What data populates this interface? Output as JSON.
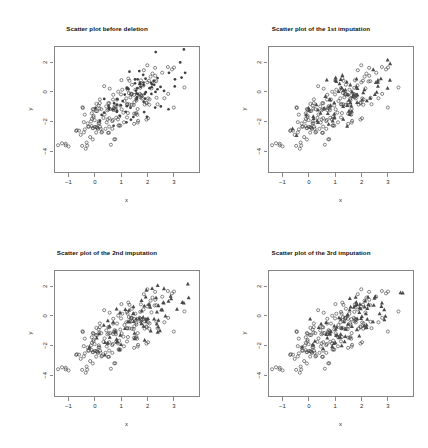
{
  "figure": {
    "width": 428,
    "height": 448,
    "background": "#ffffff",
    "layout": "2x2 grid of scatter plots",
    "marker_color": "#3f3f3f",
    "axis_color": "#555555"
  },
  "panels": [
    {
      "id": "before-deletion",
      "title": "Scatter plot before deletion",
      "xlabel": "x",
      "ylabel": "y"
    },
    {
      "id": "imputation-1",
      "title": "Scatter plot of the 1st imputation",
      "xlabel": "x",
      "ylabel": "y"
    },
    {
      "id": "imputation-2",
      "title": "Scatter plot of the 2nd imputation",
      "xlabel": "x",
      "ylabel": "y"
    },
    {
      "id": "imputation-3",
      "title": "Scatter plot of the 3rd imputation",
      "xlabel": "x",
      "ylabel": "y"
    }
  ],
  "chart_data": [
    {
      "type": "scatter",
      "panel": "before-deletion",
      "title": "Scatter plot before deletion",
      "xlabel": "x",
      "ylabel": "y",
      "xticks": [
        -1,
        0,
        1,
        2,
        3
      ],
      "yticks": [
        2,
        0,
        -2,
        -4
      ],
      "xlim": [
        -1.55,
        3.95
      ],
      "ylim": [
        -5.4,
        3.1
      ],
      "grid": false,
      "legend": null,
      "n_points": 250,
      "series": [
        {
          "name": "observed",
          "marker": "open-circle",
          "color": "#3f3f3f",
          "n": 175,
          "generator": "bivariate-normal",
          "mean_x": 0.85,
          "mean_y": -1.15,
          "sd_x": 0.95,
          "sd_y": 1.25,
          "correlation": 0.7,
          "seed": 11
        },
        {
          "name": "to-be-deleted",
          "marker": "filled-circle",
          "color": "#3f3f3f",
          "n": 75,
          "generator": "bivariate-normal",
          "mean_x": 1.55,
          "mean_y": -0.25,
          "sd_x": 0.85,
          "sd_y": 1.1,
          "correlation": 0.7,
          "seed": 23
        }
      ]
    },
    {
      "type": "scatter",
      "panel": "imputation-1",
      "title": "Scatter plot of the 1st imputation",
      "xlabel": "x",
      "ylabel": "y",
      "xticks": [
        -1,
        0,
        1,
        2,
        3
      ],
      "yticks": [
        2,
        0,
        -2,
        -4
      ],
      "xlim": [
        -1.55,
        3.95
      ],
      "ylim": [
        -5.4,
        3.1
      ],
      "grid": false,
      "legend": null,
      "n_points": 250,
      "series": [
        {
          "name": "observed",
          "marker": "open-circle",
          "color": "#3f3f3f",
          "n": 175,
          "generator": "bivariate-normal",
          "mean_x": 0.85,
          "mean_y": -1.15,
          "sd_x": 0.95,
          "sd_y": 1.25,
          "correlation": 0.7,
          "seed": 11
        },
        {
          "name": "imputed",
          "marker": "filled-triangle",
          "color": "#4a4a4a",
          "n": 75,
          "generator": "bivariate-normal",
          "mean_x": 1.6,
          "mean_y": -0.2,
          "sd_x": 0.82,
          "sd_y": 1.05,
          "correlation": 0.72,
          "seed": 37
        }
      ]
    },
    {
      "type": "scatter",
      "panel": "imputation-2",
      "title": "Scatter plot of the 2nd imputation",
      "xlabel": "x",
      "ylabel": "y",
      "xticks": [
        -1,
        0,
        1,
        2,
        3
      ],
      "yticks": [
        2,
        0,
        -2,
        -4
      ],
      "xlim": [
        -1.55,
        3.95
      ],
      "ylim": [
        -5.4,
        3.1
      ],
      "grid": false,
      "legend": null,
      "n_points": 250,
      "series": [
        {
          "name": "observed",
          "marker": "open-circle",
          "color": "#3f3f3f",
          "n": 175,
          "generator": "bivariate-normal",
          "mean_x": 0.85,
          "mean_y": -1.15,
          "sd_x": 0.95,
          "sd_y": 1.25,
          "correlation": 0.7,
          "seed": 11
        },
        {
          "name": "imputed",
          "marker": "filled-triangle",
          "color": "#4a4a4a",
          "n": 75,
          "generator": "bivariate-normal",
          "mean_x": 1.62,
          "mean_y": -0.15,
          "sd_x": 0.84,
          "sd_y": 1.08,
          "correlation": 0.71,
          "seed": 53
        }
      ]
    },
    {
      "type": "scatter",
      "panel": "imputation-3",
      "title": "Scatter plot of the 3rd imputation",
      "xlabel": "x",
      "ylabel": "y",
      "xticks": [
        -1,
        0,
        1,
        2,
        3
      ],
      "yticks": [
        2,
        0,
        -2,
        -4
      ],
      "xlim": [
        -1.55,
        3.95
      ],
      "ylim": [
        -5.4,
        3.1
      ],
      "grid": false,
      "legend": null,
      "n_points": 250,
      "series": [
        {
          "name": "observed",
          "marker": "open-circle",
          "color": "#3f3f3f",
          "n": 175,
          "generator": "bivariate-normal",
          "mean_x": 0.85,
          "mean_y": -1.15,
          "sd_x": 0.95,
          "sd_y": 1.25,
          "correlation": 0.7,
          "seed": 11
        },
        {
          "name": "imputed",
          "marker": "filled-triangle",
          "color": "#4a4a4a",
          "n": 75,
          "generator": "bivariate-normal",
          "mean_x": 1.58,
          "mean_y": -0.22,
          "sd_x": 0.86,
          "sd_y": 1.06,
          "correlation": 0.7,
          "seed": 71
        }
      ]
    }
  ]
}
